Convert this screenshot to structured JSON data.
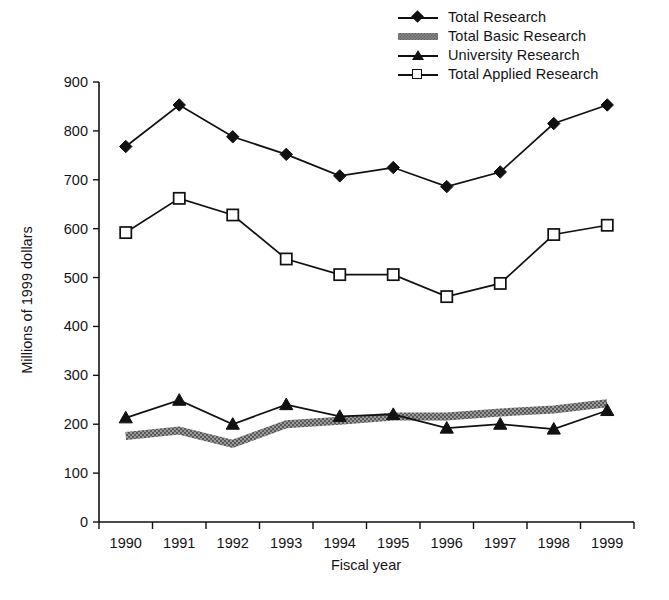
{
  "chart_data": {
    "type": "line",
    "title": "",
    "xlabel": "Fiscal year",
    "ylabel": "Millions of 1999 dollars",
    "categories": [
      "1990",
      "1991",
      "1992",
      "1993",
      "1994",
      "1995",
      "1996",
      "1997",
      "1998",
      "1999"
    ],
    "x": [
      1990,
      1991,
      1992,
      1993,
      1994,
      1995,
      1996,
      1997,
      1998,
      1999
    ],
    "ylim": [
      0,
      900
    ],
    "yticks": [
      0,
      100,
      200,
      300,
      400,
      500,
      600,
      700,
      800,
      900
    ],
    "ytick_labels": [
      "0",
      "100",
      "200",
      "300",
      "400",
      "500",
      "600",
      "700",
      "800",
      "900"
    ],
    "xtick_labels": [
      "1990",
      "1991",
      "1992",
      "1993",
      "1994",
      "1995",
      "1996",
      "1997",
      "1998",
      "1999"
    ],
    "grid": false,
    "legend_position": "top-right",
    "series": [
      {
        "name": "Total Research",
        "marker": "filled-diamond",
        "color": "#111111",
        "values": [
          768,
          853,
          788,
          752,
          708,
          725,
          686,
          716,
          815,
          853
        ]
      },
      {
        "name": "Total Basic Research",
        "marker": "shaded-band",
        "color": "#8a8a8a",
        "values": [
          176,
          187,
          160,
          200,
          207,
          216,
          216,
          224,
          230,
          243
        ]
      },
      {
        "name": "University Research",
        "marker": "filled-triangle",
        "color": "#111111",
        "values": [
          213,
          249,
          200,
          240,
          216,
          220,
          192,
          200,
          190,
          228
        ]
      },
      {
        "name": "Total Applied Research",
        "marker": "open-square",
        "color": "#111111",
        "values": [
          592,
          662,
          628,
          538,
          506,
          506,
          461,
          488,
          588,
          607
        ]
      }
    ]
  },
  "legend": {
    "items": [
      {
        "label": "Total Research",
        "key": "filled-diamond"
      },
      {
        "label": "Total Basic Research",
        "key": "shaded-band"
      },
      {
        "label": "University Research",
        "key": "filled-triangle"
      },
      {
        "label": "Total Applied Research",
        "key": "open-square"
      }
    ]
  },
  "axes": {
    "y_title": "Millions of 1999 dollars",
    "x_title": "Fiscal year"
  },
  "footer": {
    "caption": ""
  }
}
